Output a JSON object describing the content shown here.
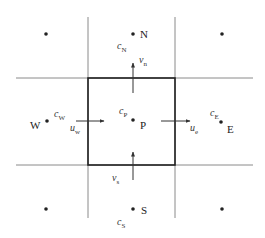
{
  "diagram": {
    "nodes": [
      {
        "id": "NW",
        "label": ""
      },
      {
        "id": "N",
        "label": "N",
        "var": "c",
        "sub": "N"
      },
      {
        "id": "NE",
        "label": ""
      },
      {
        "id": "W",
        "label": "W",
        "var": "c",
        "sub": "W"
      },
      {
        "id": "P",
        "label": "P",
        "var": "c",
        "sub": "P"
      },
      {
        "id": "E",
        "label": "E",
        "var": "c",
        "sub": "E"
      },
      {
        "id": "SW",
        "label": ""
      },
      {
        "id": "S",
        "label": "S",
        "var": "c",
        "sub": "S"
      },
      {
        "id": "SE",
        "label": ""
      }
    ],
    "face_velocities": [
      {
        "face": "north",
        "var": "v",
        "sub": "n",
        "direction": "up"
      },
      {
        "face": "south",
        "var": "v",
        "sub": "s",
        "direction": "up"
      },
      {
        "face": "west",
        "var": "u",
        "sub": "w",
        "direction": "right"
      },
      {
        "face": "east",
        "var": "u",
        "sub": "e",
        "direction": "right"
      }
    ],
    "colors": {
      "grid": "#8a8a8a",
      "control_volume": "#222222",
      "ink": "#222222"
    }
  }
}
